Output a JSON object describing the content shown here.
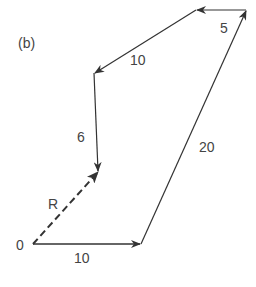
{
  "figure": {
    "panel_label": "(b)",
    "origin_label": "0",
    "resultant_label": "R",
    "vectors": [
      {
        "label": "10",
        "from": [
          33,
          244
        ],
        "to": [
          141,
          244
        ],
        "style": "solid"
      },
      {
        "label": "20",
        "from": [
          141,
          244
        ],
        "to": [
          246,
          10
        ],
        "style": "solid"
      },
      {
        "label": "5",
        "from": [
          246,
          10
        ],
        "to": [
          196,
          10
        ],
        "style": "solid"
      },
      {
        "label": "10",
        "from": [
          196,
          10
        ],
        "to": [
          94,
          73
        ],
        "style": "solid"
      },
      {
        "label": "6",
        "from": [
          94,
          73
        ],
        "to": [
          98,
          172
        ],
        "style": "solid"
      },
      {
        "label": "R",
        "from": [
          33,
          244
        ],
        "to": [
          98,
          172
        ],
        "style": "dashed"
      }
    ],
    "labels": {
      "v1": "10",
      "v2": "20",
      "v3": "5",
      "v4": "10",
      "v5": "6"
    },
    "colors": {
      "line": "#333333",
      "text": "#444444"
    }
  }
}
